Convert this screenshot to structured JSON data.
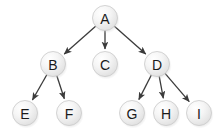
{
  "diagram": {
    "type": "tree",
    "title": "",
    "background_color": "#ffffff",
    "node": {
      "radius": 12.5,
      "fill_light": "#fefefe",
      "fill_dark": "#dcdcdc",
      "border_color": "#c9c9c9",
      "label_color": "#1a1a1a",
      "shadow_color": "#d8d8d8"
    },
    "edge": {
      "color": "#3b3b3b",
      "width": 1.3,
      "arrowhead": "filled-triangle"
    },
    "nodes": [
      {
        "id": "A",
        "label": "A",
        "x": 105,
        "y": 18
      },
      {
        "id": "B",
        "label": "B",
        "x": 53,
        "y": 64
      },
      {
        "id": "C",
        "label": "C",
        "x": 105,
        "y": 64
      },
      {
        "id": "D",
        "label": "D",
        "x": 157,
        "y": 64
      },
      {
        "id": "E",
        "label": "E",
        "x": 25,
        "y": 113
      },
      {
        "id": "F",
        "label": "F",
        "x": 69,
        "y": 113
      },
      {
        "id": "G",
        "label": "G",
        "x": 132,
        "y": 113
      },
      {
        "id": "H",
        "label": "H",
        "x": 166,
        "y": 113
      },
      {
        "id": "I",
        "label": "I",
        "x": 199,
        "y": 113
      }
    ],
    "edges": [
      {
        "from": "A",
        "to": "B"
      },
      {
        "from": "A",
        "to": "C"
      },
      {
        "from": "A",
        "to": "D"
      },
      {
        "from": "B",
        "to": "E"
      },
      {
        "from": "B",
        "to": "F"
      },
      {
        "from": "D",
        "to": "G"
      },
      {
        "from": "D",
        "to": "H"
      },
      {
        "from": "D",
        "to": "I"
      }
    ]
  }
}
